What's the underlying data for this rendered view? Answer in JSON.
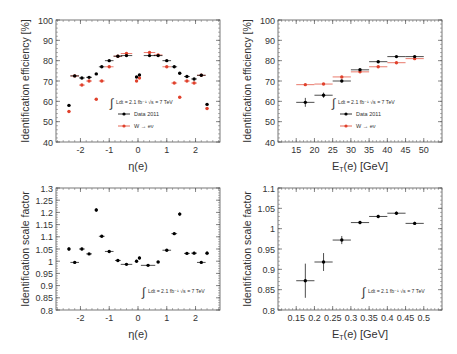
{
  "legend": {
    "lumi": "Ldt = 2.1 fb⁻¹ √s = 7 TeV",
    "data_label": "Data 2011",
    "mc_label": "W → eν",
    "data_color": "#000000",
    "mc_color": "#e0412c"
  },
  "chart_data": [
    {
      "id": "eff_vs_eta",
      "type": "scatter",
      "title": "",
      "xlabel": "η(e)",
      "ylabel": "Identification efficiency [%]",
      "xlim": [
        -2.85,
        2.85
      ],
      "ylim": [
        40,
        100
      ],
      "xticks": [
        -2,
        -1,
        0,
        1,
        2
      ],
      "yticks": [
        40,
        50,
        60,
        70,
        80,
        90,
        100
      ],
      "grid": false,
      "legend_position": "lower-center",
      "series": [
        {
          "name": "Data 2011",
          "color": "#000000",
          "x": [
            -2.4,
            -2.2,
            -1.95,
            -1.7,
            -1.45,
            -1.26,
            -1.0,
            -0.7,
            -0.4,
            -0.05,
            0.05,
            0.4,
            0.7,
            1.0,
            1.26,
            1.45,
            1.7,
            1.95,
            2.2,
            2.4
          ],
          "xerr": [
            0.05,
            0.15,
            0.1,
            0.1,
            0.05,
            0.1,
            0.15,
            0.15,
            0.2,
            0.05,
            0.05,
            0.2,
            0.15,
            0.15,
            0.1,
            0.05,
            0.1,
            0.1,
            0.15,
            0.05
          ],
          "values": [
            58,
            72.5,
            71.5,
            71.8,
            73.5,
            77,
            80,
            82.2,
            82.5,
            72,
            73,
            82.5,
            82.5,
            80,
            77,
            73.8,
            72.2,
            71,
            72.8,
            58.5
          ]
        },
        {
          "name": "W → eν",
          "color": "#e0412c",
          "x": [
            -2.4,
            -2.2,
            -1.95,
            -1.7,
            -1.45,
            -1.26,
            -1.0,
            -0.7,
            -0.4,
            -0.05,
            0.05,
            0.4,
            0.7,
            1.0,
            1.26,
            1.45,
            1.7,
            1.95,
            2.2,
            2.4
          ],
          "xerr": [
            0.05,
            0.15,
            0.1,
            0.1,
            0.05,
            0.1,
            0.15,
            0.15,
            0.2,
            0.05,
            0.05,
            0.2,
            0.15,
            0.15,
            0.1,
            0.05,
            0.1,
            0.1,
            0.15,
            0.05
          ],
          "values": [
            55,
            72.5,
            68,
            70,
            61,
            70,
            77,
            82.2,
            83.5,
            70,
            71.5,
            84,
            82.8,
            77,
            69,
            62,
            70,
            69,
            72.8,
            56.5
          ]
        }
      ]
    },
    {
      "id": "eff_vs_et",
      "type": "scatter",
      "title": "",
      "xlabel": "E_T(e) [GeV]",
      "ylabel": "Identification efficiency [%]",
      "xlim": [
        10,
        55
      ],
      "ylim": [
        40,
        100
      ],
      "xticks": [
        15,
        20,
        25,
        30,
        35,
        40,
        45,
        50
      ],
      "yticks": [
        40,
        50,
        60,
        70,
        80,
        90,
        100
      ],
      "grid": false,
      "legend_position": "lower-center",
      "series": [
        {
          "name": "Data 2011",
          "color": "#000000",
          "x": [
            17.5,
            22.5,
            27.5,
            32.5,
            37.5,
            42.5,
            47.5
          ],
          "xerr": [
            2.5,
            2.5,
            2.5,
            2.5,
            2.5,
            2.5,
            2.5
          ],
          "values": [
            59.5,
            63,
            70,
            75.5,
            79.5,
            82,
            82
          ],
          "yerr": [
            2.2,
            1.3,
            0.6,
            0.4,
            0.4,
            0.4,
            0.4
          ]
        },
        {
          "name": "W → eν",
          "color": "#e0412c",
          "x": [
            17.5,
            22.5,
            27.5,
            32.5,
            37.5,
            42.5,
            47.5
          ],
          "xerr": [
            2.5,
            2.5,
            2.5,
            2.5,
            2.5,
            2.5,
            2.5
          ],
          "values": [
            68.2,
            68.5,
            72,
            74.5,
            77,
            79,
            81
          ],
          "yerr": [
            0.3,
            0.3,
            0.3,
            0.3,
            0.3,
            0.3,
            0.3
          ]
        }
      ]
    },
    {
      "id": "sf_vs_eta",
      "type": "scatter",
      "title": "",
      "xlabel": "η(e)",
      "ylabel": "Identification scale factor",
      "xlim": [
        -2.85,
        2.85
      ],
      "ylim": [
        0.8,
        1.3
      ],
      "xticks": [
        -2,
        -1,
        0,
        1,
        2
      ],
      "yticks": [
        0.8,
        0.85,
        0.9,
        0.95,
        1.0,
        1.05,
        1.1,
        1.15,
        1.2,
        1.25,
        1.3
      ],
      "grid": false,
      "legend_position": "lower-right",
      "series": [
        {
          "name": "Data 2011 / W → eν",
          "color": "#000000",
          "x": [
            -2.4,
            -2.2,
            -1.95,
            -1.7,
            -1.45,
            -1.26,
            -1.0,
            -0.7,
            -0.4,
            -0.05,
            0.05,
            0.35,
            0.7,
            1.0,
            1.26,
            1.45,
            1.7,
            1.95,
            2.2,
            2.4
          ],
          "xerr": [
            0.05,
            0.15,
            0.1,
            0.1,
            0.05,
            0.1,
            0.15,
            0.1,
            0.2,
            0.05,
            0.05,
            0.25,
            0.05,
            0.15,
            0.1,
            0.05,
            0.1,
            0.1,
            0.15,
            0.05
          ],
          "values": [
            1.05,
            0.995,
            1.05,
            1.03,
            1.21,
            1.102,
            1.04,
            1.003,
            0.987,
            1.0,
            1.013,
            0.983,
            0.997,
            1.045,
            1.113,
            1.193,
            1.032,
            1.033,
            0.995,
            1.033
          ],
          "yerr": [
            0.008,
            0.004,
            0.006,
            0.004,
            0.008,
            0.005,
            0.004,
            0.004,
            0.003,
            0.006,
            0.006,
            0.003,
            0.004,
            0.004,
            0.005,
            0.008,
            0.004,
            0.006,
            0.004,
            0.008
          ]
        }
      ]
    },
    {
      "id": "sf_vs_et",
      "type": "scatter",
      "title": "",
      "xlabel": "E_T(e) [GeV]",
      "ylabel": "Identification scale factor",
      "xlim": [
        0.1,
        0.55
      ],
      "ylim": [
        0.8,
        1.1
      ],
      "xticks": [
        0.15,
        0.2,
        0.25,
        0.3,
        0.35,
        0.4,
        0.45,
        0.5
      ],
      "yticks": [
        0.8,
        0.85,
        0.9,
        0.95,
        1.0,
        1.05,
        1.1
      ],
      "grid": false,
      "legend_position": "lower-right",
      "series": [
        {
          "name": "Data 2011 / W → eν",
          "color": "#000000",
          "x": [
            0.175,
            0.225,
            0.275,
            0.325,
            0.375,
            0.425,
            0.475
          ],
          "xerr": [
            0.025,
            0.025,
            0.025,
            0.025,
            0.025,
            0.025,
            0.025
          ],
          "values": [
            0.872,
            0.918,
            0.972,
            1.015,
            1.03,
            1.038,
            1.013
          ],
          "yerr": [
            0.042,
            0.022,
            0.01,
            0.004,
            0.004,
            0.004,
            0.004
          ]
        }
      ]
    }
  ]
}
